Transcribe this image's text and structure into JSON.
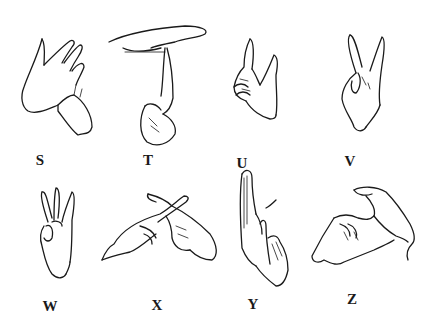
{
  "colors": {
    "ink": "#1a1a1a",
    "background": "#ffffff"
  },
  "signs": [
    {
      "letter": "S",
      "description": "hand-drawing of sign for letter S"
    },
    {
      "letter": "T",
      "description": "hand-drawing of sign for letter T"
    },
    {
      "letter": "U",
      "description": "hand-drawing of sign for letter U"
    },
    {
      "letter": "V",
      "description": "hand-drawing of sign for letter V"
    },
    {
      "letter": "W",
      "description": "hand-drawing of sign for letter W"
    },
    {
      "letter": "X",
      "description": "hand-drawing of sign for letter X"
    },
    {
      "letter": "Y",
      "description": "hand-drawing of sign for letter Y"
    },
    {
      "letter": "Z",
      "description": "hand-drawing of sign for letter Z"
    }
  ]
}
